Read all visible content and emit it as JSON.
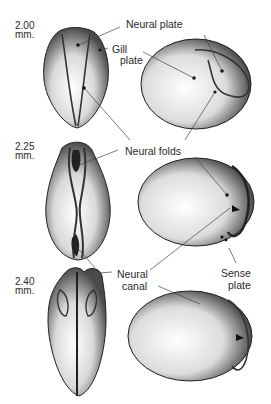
{
  "figure": {
    "stages": [
      {
        "size": "2.00",
        "unit": "mm."
      },
      {
        "size": "2.25",
        "unit": "mm."
      },
      {
        "size": "2.40",
        "unit": "mm."
      }
    ],
    "labels": {
      "neural_plate": "Neural plate",
      "gill_line1": "Gill",
      "gill_line2": "plate",
      "neural_folds": "Neural folds",
      "neural_canal_line1": "Neural",
      "neural_canal_line2": "canal",
      "sense_line1": "Sense",
      "sense_line2": "plate"
    },
    "colors": {
      "ink": "#2a2a2a",
      "shade": "#555555",
      "background": "#ffffff"
    }
  }
}
